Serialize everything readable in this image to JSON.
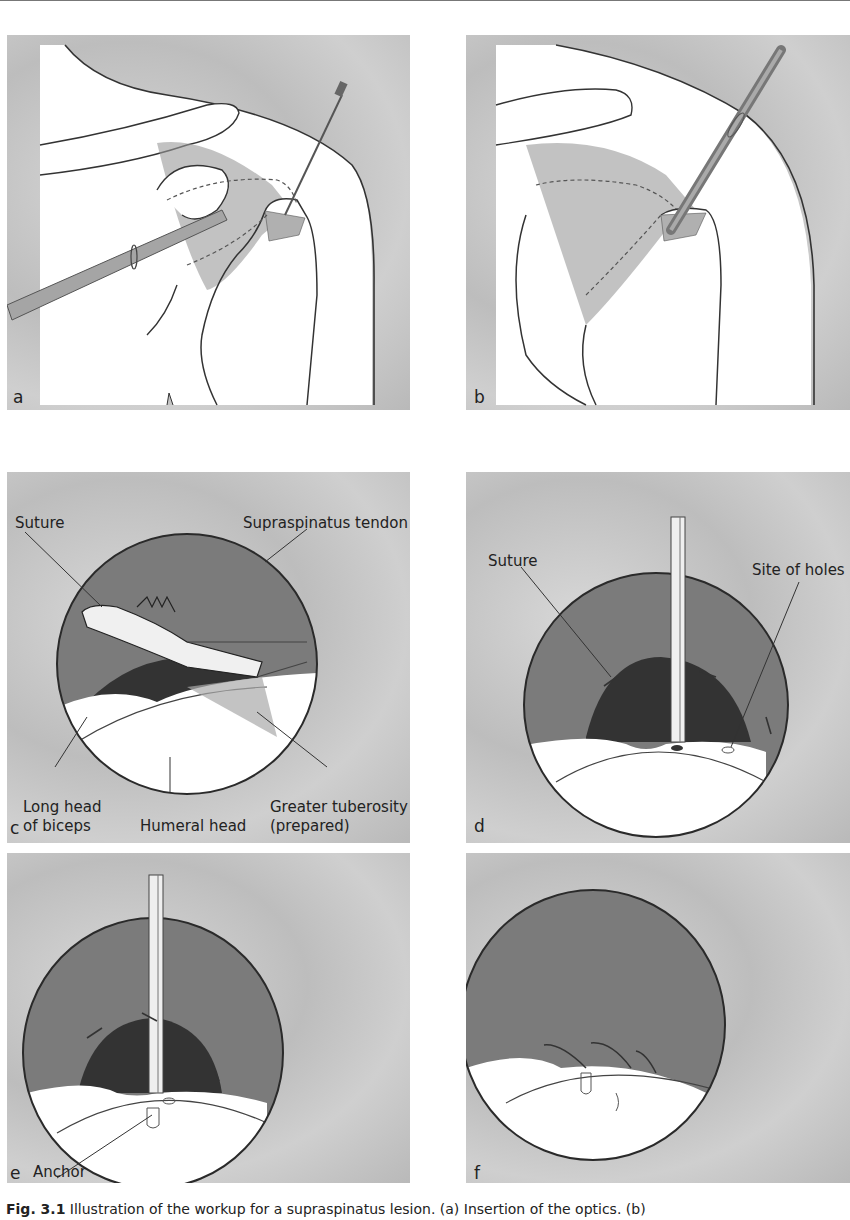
{
  "figure": {
    "panels": [
      {
        "id": "a",
        "label": "a",
        "annotations": []
      },
      {
        "id": "b",
        "label": "b",
        "annotations": []
      },
      {
        "id": "c",
        "label": "c",
        "annotations": [
          {
            "key": "suture",
            "text": "Suture"
          },
          {
            "key": "supraspinatus",
            "text": "Supraspinatus tendon"
          },
          {
            "key": "long_head_1",
            "text": "Long head"
          },
          {
            "key": "long_head_2",
            "text": "of biceps"
          },
          {
            "key": "humeral_head",
            "text": "Humeral head"
          },
          {
            "key": "greater_tub_1",
            "text": "Greater tuberosity"
          },
          {
            "key": "greater_tub_2",
            "text": "(prepared)"
          }
        ]
      },
      {
        "id": "d",
        "label": "d",
        "annotations": [
          {
            "key": "suture",
            "text": "Suture"
          },
          {
            "key": "site_holes",
            "text": "Site of holes"
          }
        ]
      },
      {
        "id": "e",
        "label": "e",
        "annotations": [
          {
            "key": "anchor",
            "text": "Anchor"
          }
        ]
      },
      {
        "id": "f",
        "label": "f",
        "annotations": []
      }
    ],
    "caption": {
      "fig_label": "Fig. 3.1",
      "text": " Illustration of the workup for a supraspinatus lesion. (a) Insertion of the optics. (b)"
    }
  },
  "colors": {
    "background_gray": "#c4c4c4",
    "tendon_gray": "#7b7b7b",
    "dark_shadow": "#333333",
    "bone_white": "#ffffff",
    "outline": "#2a2a2a"
  }
}
